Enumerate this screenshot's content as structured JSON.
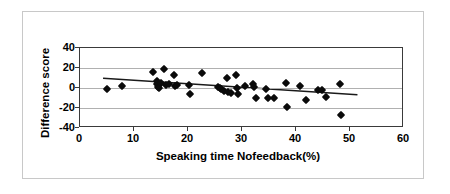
{
  "chart_data": {
    "type": "scatter",
    "title": "",
    "xlabel": "Speaking time Nofeedback(%)",
    "ylabel": "Difference score",
    "xlim": [
      0,
      60
    ],
    "ylim": [
      -40,
      40
    ],
    "xticks": [
      0,
      10,
      20,
      30,
      40,
      50,
      60
    ],
    "xtick_labels": [
      "0",
      "10",
      "20",
      "30",
      "40",
      "50",
      "60"
    ],
    "yticks": [
      -40,
      -20,
      0,
      20,
      40
    ],
    "ytick_labels": [
      "-40",
      "-20",
      "0",
      "20",
      "40"
    ],
    "grid": "horizontal",
    "legend": "none",
    "marker": "diamond",
    "marker_color": "#0a0a0a",
    "points": [
      {
        "x": 5.0,
        "y": -1
      },
      {
        "x": 7.8,
        "y": 2
      },
      {
        "x": 13.6,
        "y": 16
      },
      {
        "x": 14.2,
        "y": 7
      },
      {
        "x": 14.3,
        "y": 4
      },
      {
        "x": 14.4,
        "y": 1
      },
      {
        "x": 14.6,
        "y": 0
      },
      {
        "x": 15.0,
        "y": 5
      },
      {
        "x": 15.6,
        "y": 19
      },
      {
        "x": 16.0,
        "y": 3
      },
      {
        "x": 16.4,
        "y": 4
      },
      {
        "x": 17.4,
        "y": 13
      },
      {
        "x": 17.6,
        "y": 2
      },
      {
        "x": 18.0,
        "y": 3
      },
      {
        "x": 20.2,
        "y": 3
      },
      {
        "x": 20.4,
        "y": -6
      },
      {
        "x": 22.6,
        "y": 15
      },
      {
        "x": 25.6,
        "y": 1
      },
      {
        "x": 25.9,
        "y": 0
      },
      {
        "x": 26.2,
        "y": -1
      },
      {
        "x": 26.6,
        "y": -3
      },
      {
        "x": 27.2,
        "y": 10
      },
      {
        "x": 27.4,
        "y": -4
      },
      {
        "x": 27.9,
        "y": -5
      },
      {
        "x": 28.8,
        "y": 13
      },
      {
        "x": 29.0,
        "y": 0
      },
      {
        "x": 29.2,
        "y": -6
      },
      {
        "x": 30.6,
        "y": 2
      },
      {
        "x": 32.0,
        "y": 4
      },
      {
        "x": 32.2,
        "y": 1
      },
      {
        "x": 32.6,
        "y": -10
      },
      {
        "x": 34.4,
        "y": -1
      },
      {
        "x": 34.8,
        "y": -10
      },
      {
        "x": 36.0,
        "y": -10
      },
      {
        "x": 38.2,
        "y": 5
      },
      {
        "x": 38.4,
        "y": -19
      },
      {
        "x": 40.8,
        "y": 2
      },
      {
        "x": 41.8,
        "y": -12
      },
      {
        "x": 44.0,
        "y": -2
      },
      {
        "x": 44.8,
        "y": -2
      },
      {
        "x": 45.6,
        "y": -9
      },
      {
        "x": 48.2,
        "y": 4
      },
      {
        "x": 48.4,
        "y": -27
      }
    ],
    "trendline": {
      "x_start": 4.3,
      "y_start": 9,
      "x_end": 51.7,
      "y_end": -8,
      "color": "#1a1a1a"
    }
  }
}
